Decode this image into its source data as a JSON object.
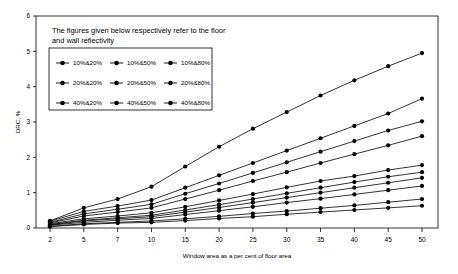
{
  "chart_data": {
    "type": "line",
    "title": "",
    "note": "The figures given below respectively refer to the floor and wall reflectivity",
    "xlabel": "Window area as a per cent of floor area",
    "ylabel": "DRC, %",
    "categories": [
      2,
      5,
      7,
      10,
      15,
      20,
      25,
      30,
      35,
      40,
      45,
      50
    ],
    "category_labels": [
      "2",
      "5",
      "7",
      "10",
      "15",
      "20",
      "25",
      "30",
      "35",
      "40",
      "45",
      "50"
    ],
    "ylim": [
      0,
      6
    ],
    "yticks": [
      0,
      1,
      2,
      3,
      4,
      5,
      6
    ],
    "ytick_labels": [
      "0",
      "1",
      "2",
      "3",
      "4",
      "5",
      "6"
    ],
    "grid": false,
    "legend_position": "inside-top-left",
    "legend_layout": "3x3",
    "marker": "filled-circle",
    "line_color": "#000000",
    "series": [
      {
        "name": "10%&20%",
        "values": [
          0.04,
          0.1,
          0.14,
          0.16,
          0.21,
          0.27,
          0.32,
          0.39,
          0.45,
          0.51,
          0.57,
          0.63
        ]
      },
      {
        "name": "10%&50%",
        "values": [
          0.05,
          0.12,
          0.16,
          0.2,
          0.26,
          0.33,
          0.41,
          0.48,
          0.56,
          0.64,
          0.73,
          0.82
        ]
      },
      {
        "name": "10%&80%",
        "values": [
          0.08,
          0.16,
          0.22,
          0.27,
          0.38,
          0.49,
          0.6,
          0.72,
          0.83,
          0.95,
          1.07,
          1.19
        ]
      },
      {
        "name": "20%&20%",
        "values": [
          0.09,
          0.2,
          0.26,
          0.32,
          0.45,
          0.58,
          0.72,
          0.86,
          1.0,
          1.14,
          1.28,
          1.42
        ]
      },
      {
        "name": "20%&50%",
        "values": [
          0.1,
          0.22,
          0.29,
          0.36,
          0.51,
          0.66,
          0.82,
          0.98,
          1.14,
          1.3,
          1.45,
          1.58
        ]
      },
      {
        "name": "20%&80%",
        "values": [
          0.12,
          0.26,
          0.34,
          0.43,
          0.6,
          0.78,
          0.96,
          1.15,
          1.33,
          1.47,
          1.64,
          1.78
        ]
      },
      {
        "name": "40%&20%",
        "values": [
          0.14,
          0.34,
          0.45,
          0.57,
          0.82,
          1.07,
          1.33,
          1.58,
          1.84,
          2.09,
          2.34,
          2.6
        ]
      },
      {
        "name": "40%&50%",
        "values": [
          0.16,
          0.4,
          0.53,
          0.67,
          0.97,
          1.26,
          1.56,
          1.86,
          2.16,
          2.46,
          2.76,
          3.02
        ]
      },
      {
        "name": "40%&80%",
        "values": [
          0.19,
          0.47,
          0.62,
          0.79,
          1.14,
          1.49,
          1.84,
          2.19,
          2.54,
          2.89,
          3.24,
          3.66
        ]
      }
    ],
    "top_series": {
      "name": "top-envelope",
      "values": [
        0.2,
        0.57,
        0.82,
        1.17,
        1.74,
        2.3,
        2.81,
        3.28,
        3.75,
        4.18,
        4.58,
        4.95
      ]
    },
    "legend_entries": [
      "10%&20%",
      "10%&50%",
      "10%&80%",
      "20%&20%",
      "20%&50%",
      "20%&80%",
      "40%&20%",
      "40%&50%",
      "40%&80%"
    ]
  }
}
